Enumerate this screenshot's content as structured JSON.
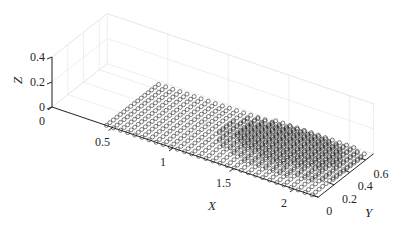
{
  "chart_data": {
    "type": "scatter",
    "title": "",
    "xlabel": "X",
    "ylabel": "Y",
    "zlabel": "Z",
    "xlim": [
      0,
      2.2
    ],
    "ylim": [
      0,
      0.7
    ],
    "zlim": [
      0,
      0.4
    ],
    "grid": true,
    "legend": null,
    "x_ticks": [
      0,
      0.5,
      1,
      1.5,
      2
    ],
    "x_tick_labels": [
      "0",
      "0.5",
      "1",
      "1.5",
      "2"
    ],
    "y_ticks": [
      0,
      0.2,
      0.4,
      0.6
    ],
    "y_tick_labels": [
      "0",
      "0.2",
      "0.4",
      "0.6"
    ],
    "z_ticks": [
      0,
      0.2,
      0.4
    ],
    "z_tick_labels": [
      "0",
      "0.2",
      "0.4"
    ],
    "series": [
      {
        "name": "points",
        "marker": "o",
        "marker_color": "#000000",
        "description": "Regular grid of points lying near Z=0 plane",
        "x_range": [
          0.45,
          2.15
        ],
        "y_range": [
          0.0,
          0.66
        ],
        "x_count": 30,
        "y_count": 16,
        "z_approx": 0.0
      }
    ]
  },
  "colors": {
    "axis": "#262626",
    "grid": "#e6e6e6",
    "marker": "#1a1a1a"
  }
}
